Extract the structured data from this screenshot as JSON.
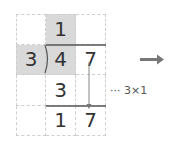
{
  "division": {
    "divisor": "3",
    "dividend_digits": [
      "4",
      "7"
    ],
    "quotient_digits": [
      "1"
    ],
    "product_digits": [
      "3"
    ],
    "remainder_digits": [
      "1",
      "7"
    ]
  },
  "annotation": {
    "text": "··· 3×1"
  },
  "colors": {
    "shade": "#d9d9d9",
    "line": "#555555",
    "grid": "#cfcfcf",
    "arrow": "#777777"
  },
  "icons": {
    "right_arrow": "right-arrow-icon",
    "bring_down_arrow": "down-arrow-icon"
  }
}
